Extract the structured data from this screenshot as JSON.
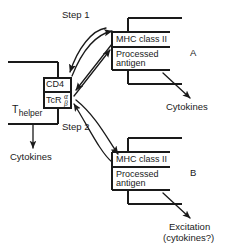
{
  "figure": {
    "kind": "immunology-schematic",
    "ink_color": "#1a1a1a",
    "background_color": "#ffffff"
  },
  "steps": {
    "step1": "Step 1",
    "step2": "Step 2"
  },
  "t_cell": {
    "name_main": "T",
    "name_sub": "helper",
    "cd4_label": "CD4",
    "tcr_label": "TcR",
    "tcr_alpha": "α",
    "tcr_beta": "β",
    "output_label": "Cytokines"
  },
  "apc_a": {
    "tag": "A",
    "mhc_label": "MHC class II",
    "antigen_line1": "Processed",
    "antigen_line2": "antigen",
    "output_label": "Cytokines"
  },
  "apc_b": {
    "tag": "B",
    "mhc_label": "MHC class II",
    "antigen_line1": "Processed",
    "antigen_line2": "antigen",
    "output_line1": "Excitation",
    "output_line2": "(cytokines?)"
  }
}
